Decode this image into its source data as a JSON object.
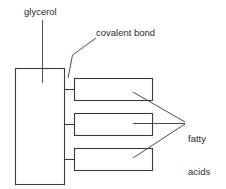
{
  "diagram": {
    "background_color": "#ffffff",
    "stroke_color": "#3a3a3a",
    "text_color": "#2b2b2b",
    "labels": {
      "glycerol": "glycerol",
      "covalent_bond": "covalent bond",
      "fatty_acids_line1": "fatty",
      "fatty_acids_line2": "acids"
    },
    "shapes": {
      "glycerol_box": {
        "x": 15,
        "y": 68,
        "width": 50,
        "height": 117
      },
      "fatty_acid_boxes": [
        {
          "x": 74,
          "y": 78,
          "width": 79,
          "height": 23
        },
        {
          "x": 74,
          "y": 113,
          "width": 79,
          "height": 23
        },
        {
          "x": 74,
          "y": 148,
          "width": 79,
          "height": 23
        }
      ],
      "covalent_bond_stubs": [
        {
          "x1": 65,
          "y1": 89,
          "x2": 74,
          "y2": 89
        },
        {
          "x1": 65,
          "y1": 124,
          "x2": 74,
          "y2": 124
        },
        {
          "x1": 65,
          "y1": 159,
          "x2": 74,
          "y2": 159
        }
      ]
    },
    "leaders": {
      "glycerol": {
        "x1": 42,
        "y1": 20,
        "x2": 42,
        "y2": 83
      },
      "covalent_bond": [
        {
          "x1": 68,
          "y1": 78,
          "x2": 72,
          "y2": 55
        },
        {
          "x1": 72,
          "y1": 55,
          "x2": 96,
          "y2": 38
        }
      ],
      "fatty_acids": [
        {
          "x1": 133,
          "y1": 92,
          "x2": 185,
          "y2": 122
        },
        {
          "x1": 133,
          "y1": 123,
          "x2": 185,
          "y2": 123
        },
        {
          "x1": 133,
          "y1": 158,
          "x2": 185,
          "y2": 124
        }
      ]
    }
  }
}
